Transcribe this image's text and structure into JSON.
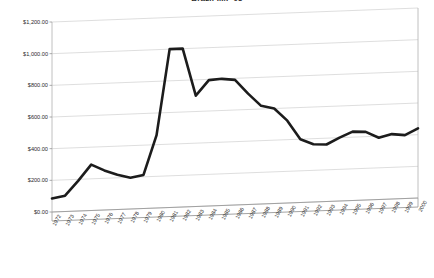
{
  "chart_data": {
    "type": "line",
    "title": "Brazil IMF 05",
    "xlabel": "",
    "ylabel": "",
    "ylim": [
      0,
      1200
    ],
    "ytick_labels": [
      "$1,200.00",
      "$1,000.00",
      "$800.00",
      "$600.00",
      "$400.00",
      "$200.00",
      "$0.00"
    ],
    "ytick_values": [
      1200,
      1000,
      800,
      600,
      400,
      200,
      0
    ],
    "grid": true,
    "legend": "none",
    "style": "3d-perspective",
    "line_color": "#1c1c1c",
    "grid_color": "#c8c8c8",
    "categories": [
      "1972",
      "1973",
      "1974",
      "1975",
      "1976",
      "1977",
      "1978",
      "1979",
      "1980",
      "1981",
      "1982",
      "1983",
      "1984",
      "1985",
      "1986",
      "1987",
      "1988",
      "1989",
      "1990",
      "1991",
      "1992",
      "1993",
      "1994",
      "1995",
      "1996",
      "1997",
      "1998",
      "1999",
      "2000"
    ],
    "values": [
      85,
      100,
      190,
      290,
      250,
      220,
      198,
      212,
      460,
      1000,
      1000,
      700,
      795,
      800,
      790,
      700,
      620,
      600,
      520,
      400,
      365,
      360,
      400,
      435,
      430,
      390,
      410,
      400,
      440
    ],
    "series": [
      {
        "name": "Brazil IMF 05",
        "values": [
          85,
          100,
          190,
          290,
          250,
          220,
          198,
          212,
          460,
          1000,
          1000,
          700,
          795,
          800,
          790,
          700,
          620,
          600,
          520,
          400,
          365,
          360,
          400,
          435,
          430,
          390,
          410,
          400,
          440
        ]
      }
    ]
  }
}
